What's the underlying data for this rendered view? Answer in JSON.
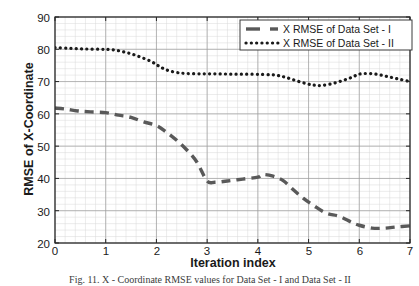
{
  "chart_data": {
    "type": "line",
    "title": "",
    "xlabel": "Iteration index",
    "ylabel": "RMSE of X-Coordinate",
    "xlim": [
      0,
      7
    ],
    "ylim": [
      20,
      90
    ],
    "xticks": [
      0,
      1,
      2,
      3,
      4,
      5,
      6,
      7
    ],
    "yticks": [
      20,
      30,
      40,
      50,
      60,
      70,
      80,
      90
    ],
    "grid": true,
    "minor_grid": true,
    "legend_position": "top-right",
    "x": [
      0,
      0.25,
      0.5,
      0.75,
      1,
      1.25,
      1.5,
      1.75,
      2,
      2.25,
      2.5,
      2.75,
      3,
      3.25,
      3.5,
      3.75,
      4,
      4.25,
      4.5,
      4.75,
      5,
      5.25,
      5.5,
      5.75,
      6,
      6.25,
      6.5,
      6.75,
      7
    ],
    "series": [
      {
        "name": "X RMSE of Data Set - I",
        "style": "dashed",
        "color": "#595959",
        "values": [
          61.8,
          61.4,
          60.7,
          60.4,
          60.5,
          59.7,
          58.9,
          57.8,
          56.6,
          54.6,
          52.0,
          48.7,
          45.1,
          42.0,
          39.6,
          38.9,
          39.0,
          39.3,
          39.8,
          40.2,
          40.5,
          41.2,
          41.1,
          40.5,
          39.2,
          37.5,
          35.5,
          33.2,
          31.0
        ]
      },
      {
        "name": "X RMSE of  Data Set - II",
        "style": "dotted",
        "color": "#1a1a1a",
        "values": [
          80.5,
          80.4,
          80.2,
          80.1,
          80.0,
          79.8,
          79.2,
          78.2,
          77.0,
          75.6,
          74.2,
          73.2,
          72.6,
          72.5,
          72.5,
          72.5,
          72.5,
          72.5,
          72.4,
          72.3,
          72.2,
          72.1,
          71.9,
          71.4,
          70.8,
          70.1,
          69.5,
          69.0,
          68.7
        ]
      }
    ],
    "series_full": [
      {
        "name": "X RMSE of Data Set - I",
        "style": "dashed",
        "color": "#595959",
        "points": [
          [
            0.0,
            61.8
          ],
          [
            0.2,
            61.5
          ],
          [
            0.45,
            60.9
          ],
          [
            0.7,
            60.6
          ],
          [
            1.0,
            60.4
          ],
          [
            1.25,
            59.6
          ],
          [
            1.5,
            58.9
          ],
          [
            1.75,
            57.5
          ],
          [
            2.0,
            56.4
          ],
          [
            2.2,
            54.3
          ],
          [
            2.4,
            51.8
          ],
          [
            2.6,
            48.8
          ],
          [
            2.8,
            45.0
          ],
          [
            3.0,
            39.2
          ],
          [
            3.15,
            38.8
          ],
          [
            3.4,
            39.2
          ],
          [
            3.7,
            39.8
          ],
          [
            4.0,
            40.4
          ],
          [
            4.1,
            41.2
          ],
          [
            4.3,
            40.7
          ],
          [
            4.5,
            39.3
          ],
          [
            4.7,
            36.5
          ],
          [
            4.9,
            33.8
          ],
          [
            5.1,
            31.6
          ],
          [
            5.35,
            29.2
          ],
          [
            5.6,
            28.3
          ],
          [
            5.85,
            26.4
          ],
          [
            6.0,
            25.5
          ],
          [
            6.25,
            24.6
          ],
          [
            6.5,
            24.6
          ],
          [
            6.75,
            25.0
          ],
          [
            7.0,
            25.3
          ]
        ]
      },
      {
        "name": "X RMSE of  Data Set - II",
        "style": "dotted",
        "color": "#1a1a1a",
        "points": [
          [
            0.0,
            80.5
          ],
          [
            0.3,
            80.3
          ],
          [
            0.6,
            80.1
          ],
          [
            0.9,
            80.0
          ],
          [
            1.1,
            79.9
          ],
          [
            1.3,
            79.4
          ],
          [
            1.5,
            78.6
          ],
          [
            1.7,
            77.5
          ],
          [
            1.9,
            76.2
          ],
          [
            2.05,
            74.8
          ],
          [
            2.2,
            73.6
          ],
          [
            2.4,
            72.8
          ],
          [
            2.6,
            72.5
          ],
          [
            2.9,
            72.4
          ],
          [
            3.2,
            72.4
          ],
          [
            3.5,
            72.3
          ],
          [
            3.8,
            72.3
          ],
          [
            4.1,
            72.2
          ],
          [
            4.35,
            72.0
          ],
          [
            4.55,
            71.3
          ],
          [
            4.75,
            70.3
          ],
          [
            4.95,
            69.4
          ],
          [
            5.1,
            68.9
          ],
          [
            5.25,
            68.8
          ],
          [
            5.45,
            69.3
          ],
          [
            5.65,
            70.2
          ],
          [
            5.85,
            71.3
          ],
          [
            6.0,
            72.3
          ],
          [
            6.2,
            72.5
          ],
          [
            6.4,
            72.1
          ],
          [
            6.6,
            71.4
          ],
          [
            6.8,
            70.7
          ],
          [
            7.0,
            70.0
          ]
        ]
      }
    ]
  },
  "legend": {
    "entries": [
      {
        "label": "X RMSE of Data Set - I",
        "style": "dashed"
      },
      {
        "label": "X RMSE of  Data Set - II",
        "style": "dotted"
      }
    ]
  },
  "axes": {
    "y_tick_labels": [
      "90",
      "80",
      "70",
      "60",
      "50",
      "40",
      "30",
      "20"
    ],
    "x_tick_labels": [
      "0",
      "1",
      "2",
      "3",
      "4",
      "5",
      "6",
      "7"
    ]
  },
  "caption": {
    "text": "Fig. 11.  X - Coordinate RMSE values for Data Set - I and Data Set - II"
  }
}
